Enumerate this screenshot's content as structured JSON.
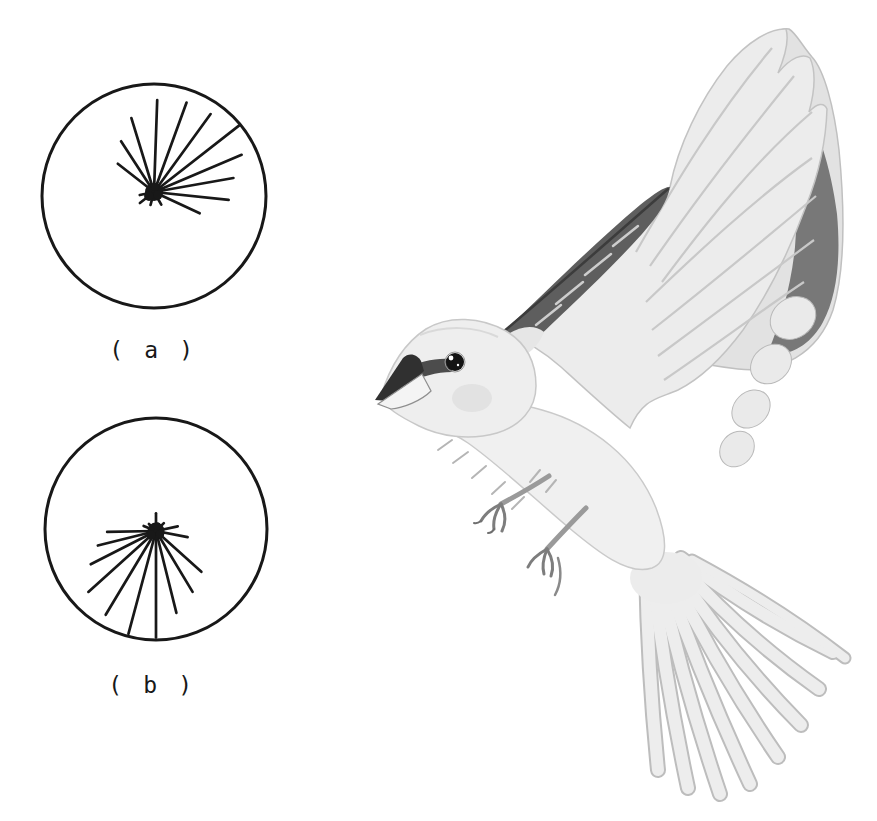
{
  "page": {
    "background": "#ffffff",
    "ink": "#181818"
  },
  "figure": {
    "type": "scanned-book-figure",
    "panel_a_label": "( a )",
    "panel_b_label": "( b )",
    "illustration_alt": "Halftone grayscale illustration of a small songbird (sparrow) in fluttering flight, facing left, wings raised high, legs extended forward, tail fanned downward"
  },
  "chart_data": [
    {
      "type": "circular-vector-diagram",
      "panel": "a",
      "label": "( a )",
      "description": "Orientation diagram (a): individual bearings radiate from a central cluster, fanning mainly from northwest through north to east",
      "angle_convention": "angle_deg is a compass bearing, 0 = up (north), clockwise; r_frac is vector length as a fraction of circle radius",
      "circle": {
        "cx": 154,
        "cy": 196,
        "r": 112,
        "stroke_width": 3
      },
      "origin": {
        "x": 154,
        "y": 192
      },
      "blob_radius": 9,
      "vector_stroke_width": 2.7,
      "vectors": [
        {
          "angle_deg": 2,
          "r_frac": 0.82
        },
        {
          "angle_deg": 20,
          "r_frac": 0.85
        },
        {
          "angle_deg": 36,
          "r_frac": 0.86
        },
        {
          "angle_deg": 52,
          "r_frac": 0.97
        },
        {
          "angle_deg": 67,
          "r_frac": 0.85
        },
        {
          "angle_deg": 80,
          "r_frac": 0.72
        },
        {
          "angle_deg": 96,
          "r_frac": 0.67
        },
        {
          "angle_deg": 115,
          "r_frac": 0.45
        },
        {
          "angle_deg": 343,
          "r_frac": 0.69
        },
        {
          "angle_deg": 327,
          "r_frac": 0.54
        },
        {
          "angle_deg": 308,
          "r_frac": 0.41
        },
        {
          "angle_deg": 150,
          "r_frac": 0.13
        },
        {
          "angle_deg": 195,
          "r_frac": 0.12
        },
        {
          "angle_deg": 232,
          "r_frac": 0.16
        },
        {
          "angle_deg": 258,
          "r_frac": 0.13
        }
      ]
    },
    {
      "type": "circular-vector-diagram",
      "panel": "b",
      "label": "( b )",
      "description": "Orientation diagram (b): bearings radiate from a central cluster, fanning mainly southward (southeast through south to west), with short spikes up and to the sides",
      "angle_convention": "angle_deg is a compass bearing, 0 = up (north), clockwise; r_frac is vector length as a fraction of circle radius",
      "circle": {
        "cx": 156,
        "cy": 529,
        "r": 111,
        "stroke_width": 3
      },
      "origin": {
        "x": 156,
        "y": 531
      },
      "blob_radius": 8.5,
      "vector_stroke_width": 2.7,
      "vectors": [
        {
          "angle_deg": 180,
          "r_frac": 0.96
        },
        {
          "angle_deg": 195,
          "r_frac": 0.96
        },
        {
          "angle_deg": 211,
          "r_frac": 0.88
        },
        {
          "angle_deg": 228,
          "r_frac": 0.82
        },
        {
          "angle_deg": 243,
          "r_frac": 0.66
        },
        {
          "angle_deg": 256,
          "r_frac": 0.54
        },
        {
          "angle_deg": 269,
          "r_frac": 0.44
        },
        {
          "angle_deg": 166,
          "r_frac": 0.76
        },
        {
          "angle_deg": 149,
          "r_frac": 0.64
        },
        {
          "angle_deg": 132,
          "r_frac": 0.55
        },
        {
          "angle_deg": 101,
          "r_frac": 0.29
        },
        {
          "angle_deg": 0,
          "r_frac": 0.16
        },
        {
          "angle_deg": 78,
          "r_frac": 0.2
        },
        {
          "angle_deg": 292,
          "r_frac": 0.12
        },
        {
          "angle_deg": 45,
          "r_frac": 0.1
        },
        {
          "angle_deg": 315,
          "r_frac": 0.09
        }
      ]
    }
  ]
}
